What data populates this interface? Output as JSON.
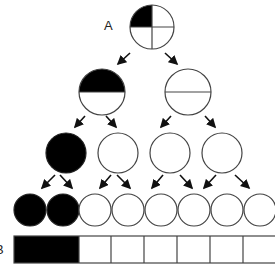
{
  "diagram": {
    "labels": {
      "a": "A",
      "b": "B"
    },
    "colors": {
      "fill": "#000000",
      "stroke": "#444444",
      "empty": "#ffffff"
    },
    "levels": [
      {
        "level": 1,
        "nodes": [
          {
            "shaded": "quarter-top-left",
            "fraction": "1/4"
          }
        ]
      },
      {
        "level": 2,
        "nodes": [
          {
            "shaded": "top-half",
            "fraction": "1/2"
          },
          {
            "shaded": "none-halved",
            "fraction": "0"
          }
        ]
      },
      {
        "level": 3,
        "nodes": [
          {
            "shaded": "full"
          },
          {
            "shaded": "none"
          },
          {
            "shaded": "none"
          },
          {
            "shaded": "none"
          }
        ]
      },
      {
        "level": 4,
        "nodes": [
          {
            "shaded": "full"
          },
          {
            "shaded": "full"
          },
          {
            "shaded": "none"
          },
          {
            "shaded": "none"
          },
          {
            "shaded": "none"
          },
          {
            "shaded": "none"
          },
          {
            "shaded": "none"
          },
          {
            "shaded": "none"
          }
        ]
      }
    ],
    "bar_b": {
      "cells": 8,
      "shaded_cells": 2
    },
    "caption_clipped": ""
  }
}
